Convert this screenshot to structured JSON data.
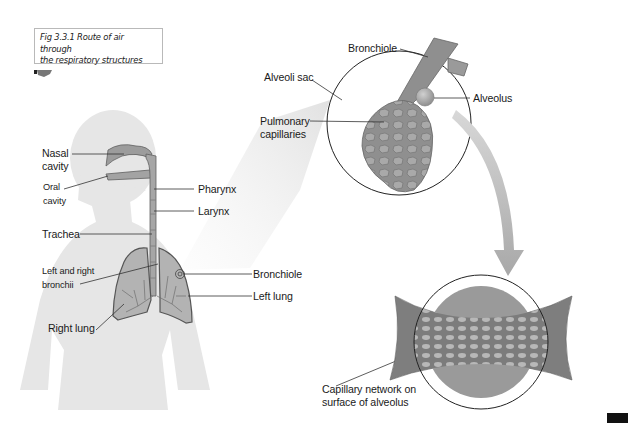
{
  "figure": {
    "caption_line1": "Fig 3.3.1 Route of air through",
    "caption_line2": "the respiratory structures"
  },
  "labels": {
    "nasal_cavity_1": "Nasal",
    "nasal_cavity_2": "cavity",
    "oral_cavity_1": "Oral",
    "oral_cavity_2": "cavity",
    "pharynx": "Pharynx",
    "larynx": "Larynx",
    "trachea": "Trachea",
    "bronchii_1": "Left and right",
    "bronchii_2": "bronchii",
    "right_lung": "Right lung",
    "bronchiole_body": "Bronchiole",
    "left_lung": "Left lung",
    "bronchiole_detail": "Bronchiole",
    "alveoli_sac": "Alveoli sac",
    "alveolus": "Alveolus",
    "pulmonary_capillaries_1": "Pulmonary",
    "pulmonary_capillaries_2": "capillaries",
    "capillary_network_1": "Capillary network on",
    "capillary_network_2": "surface of alveolus"
  },
  "colors": {
    "silhouette": "#e6e6e6",
    "airway": "#9c9c9c",
    "lung_fill": "#b3b3b3",
    "outline": "#555555",
    "arrow": "#b5b5b5",
    "zoom_cone": "#ececec"
  }
}
